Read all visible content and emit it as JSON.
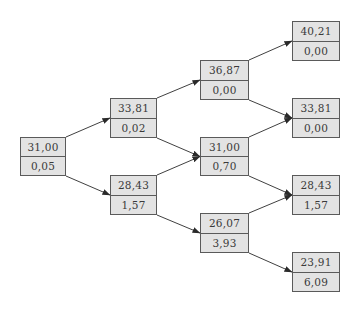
{
  "diagram": {
    "type": "binomial-tree",
    "colors": {
      "node_fill": "#e3e3e3",
      "node_border": "#5a5a5a",
      "text": "#3a3a3a",
      "edge": "#2a2a2a"
    },
    "nodes": [
      {
        "id": "n0",
        "step": 0,
        "top": "31,00",
        "bottom": "0,05",
        "x": 20,
        "y": 137,
        "w": 46,
        "h": 39
      },
      {
        "id": "n1u",
        "step": 1,
        "top": "33,81",
        "bottom": "0,02",
        "x": 110,
        "y": 98,
        "w": 47,
        "h": 40
      },
      {
        "id": "n1d",
        "step": 1,
        "top": "28,43",
        "bottom": "1,57",
        "x": 110,
        "y": 175,
        "w": 47,
        "h": 40
      },
      {
        "id": "n2uu",
        "step": 2,
        "top": "36,87",
        "bottom": "0,00",
        "x": 200,
        "y": 60,
        "w": 49,
        "h": 40
      },
      {
        "id": "n2ud",
        "step": 2,
        "top": "31,00",
        "bottom": "0,70",
        "x": 200,
        "y": 137,
        "w": 49,
        "h": 39
      },
      {
        "id": "n2dd",
        "step": 2,
        "top": "26,07",
        "bottom": "3,93",
        "x": 200,
        "y": 213,
        "w": 49,
        "h": 40
      },
      {
        "id": "n3a",
        "step": 3,
        "top": "40,21",
        "bottom": "0,00",
        "x": 292,
        "y": 21,
        "w": 48,
        "h": 40
      },
      {
        "id": "n3b",
        "step": 3,
        "top": "33,81",
        "bottom": "0,00",
        "x": 292,
        "y": 98,
        "w": 48,
        "h": 40
      },
      {
        "id": "n3c",
        "step": 3,
        "top": "28,43",
        "bottom": "1,57",
        "x": 292,
        "y": 175,
        "w": 48,
        "h": 40
      },
      {
        "id": "n3d",
        "step": 3,
        "top": "23,91",
        "bottom": "6,09",
        "x": 292,
        "y": 252,
        "w": 48,
        "h": 40
      }
    ],
    "edges": [
      {
        "from": "n0",
        "to": "n1u",
        "dir": "up"
      },
      {
        "from": "n0",
        "to": "n1d",
        "dir": "down"
      },
      {
        "from": "n1u",
        "to": "n2uu",
        "dir": "up"
      },
      {
        "from": "n1u",
        "to": "n2ud",
        "dir": "down"
      },
      {
        "from": "n1d",
        "to": "n2ud",
        "dir": "up"
      },
      {
        "from": "n1d",
        "to": "n2dd",
        "dir": "down"
      },
      {
        "from": "n2uu",
        "to": "n3a",
        "dir": "up"
      },
      {
        "from": "n2uu",
        "to": "n3b",
        "dir": "down"
      },
      {
        "from": "n2ud",
        "to": "n3b",
        "dir": "up"
      },
      {
        "from": "n2ud",
        "to": "n3c",
        "dir": "down"
      },
      {
        "from": "n2dd",
        "to": "n3c",
        "dir": "up"
      },
      {
        "from": "n2dd",
        "to": "n3d",
        "dir": "down"
      }
    ]
  }
}
